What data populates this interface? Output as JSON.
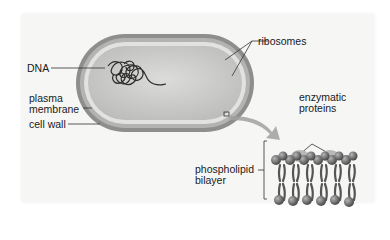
{
  "diagram": {
    "labels": {
      "dna": "DNA",
      "ribosomes": "ribosomes",
      "plasma_membrane_line1": "plasma",
      "plasma_membrane_line2": "membrane",
      "cell_wall": "cell wall",
      "enzymatic_proteins_line1": "enzymatic",
      "enzymatic_proteins_line2": "proteins",
      "phospholipid_bilayer_line1": "phospholipid",
      "phospholipid_bilayer_line2": "bilayer"
    },
    "colors": {
      "background": "#f6f6f5",
      "cell_wall": "#8a8a8a",
      "membrane": "#d8d8d6",
      "cytoplasm": "#c9c9c7",
      "dna": "#2a2a2a",
      "arrow": "#9a9a9a",
      "lipid_head": "#6e6e6e",
      "lipid_tail": "#555555"
    }
  }
}
